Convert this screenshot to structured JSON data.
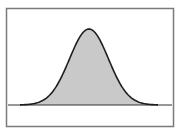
{
  "chart_data": {
    "type": "area",
    "title": "",
    "xlabel": "",
    "ylabel": "",
    "distribution": "normal",
    "mean": 0,
    "std": 1,
    "xlim": [
      -3.5,
      3.5
    ],
    "ylim": [
      0,
      0.45
    ],
    "grid": false,
    "legend": null,
    "x": [
      -3.5,
      -3,
      -2.5,
      -2,
      -1.5,
      -1,
      -0.5,
      0,
      0.5,
      1,
      1.5,
      2,
      2.5,
      3,
      3.5
    ],
    "values": [
      0.0009,
      0.0044,
      0.0175,
      0.054,
      0.1295,
      0.242,
      0.3521,
      0.3989,
      0.3521,
      0.242,
      0.1295,
      0.054,
      0.0175,
      0.0044,
      0.0009
    ],
    "colors": {
      "fill": "#c9c9c9",
      "stroke": "#1e1e1e",
      "frame": "#7a7a7a",
      "baseline": "#333333"
    }
  }
}
